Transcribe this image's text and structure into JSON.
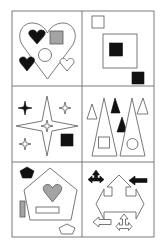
{
  "puzzle": {
    "type": "visual-analogy-grid",
    "rows": 3,
    "cols": 2,
    "colors": {
      "outline": "#6a6a6a",
      "black": "#111111",
      "gray": "#a4a4a4",
      "grid": "#7a7a7a",
      "background": "#ffffff"
    },
    "cells": [
      {
        "id": "r1c1",
        "theme": "hearts",
        "shapes": [
          "large-heart-outline",
          "black-heart",
          "gray-square",
          "outline-circle",
          "black-heart",
          "small-heart-outline"
        ]
      },
      {
        "id": "r1c2",
        "theme": "squares",
        "shapes": [
          "small-square-outline",
          "large-square-outline",
          "black-square",
          "black-square"
        ]
      },
      {
        "id": "r2c1",
        "theme": "stars",
        "shapes": [
          "large-4-point-star-outline",
          "black-small-star",
          "outline-small-star",
          "outline-small-star-center",
          "outline-small-star",
          "black-square"
        ]
      },
      {
        "id": "r2c2",
        "theme": "triangles",
        "shapes": [
          "small-triangle-outline",
          "tall-triangle-outline",
          "black-triangle",
          "black-triangle",
          "tall-triangle-outline",
          "small-triangle-outline",
          "square-outline",
          "circle-outline"
        ]
      },
      {
        "id": "r3c1",
        "theme": "pentagons",
        "shapes": [
          "black-pentagon",
          "large-pentagon-outline",
          "gray-heart",
          "rectangle-outline",
          "gray-vertical-rectangle",
          "small-pentagon-outline"
        ]
      },
      {
        "id": "r3c2",
        "theme": "arrows",
        "shapes": [
          "black-three-way-arrow",
          "large-compound-arrow-outline",
          "black-left-arrow",
          "outline-left-arrow",
          "outline-small-three-way-arrow"
        ]
      }
    ]
  }
}
